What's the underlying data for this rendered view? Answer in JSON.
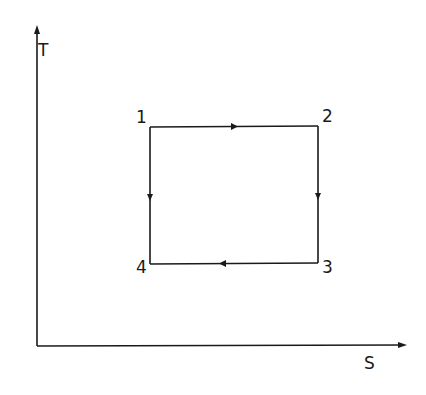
{
  "diagram": {
    "type": "T-S diagram (rectangular cycle)",
    "axes": {
      "y_label": "T",
      "x_label": "S"
    },
    "states": [
      {
        "id": "1",
        "label": "1"
      },
      {
        "id": "2",
        "label": "2"
      },
      {
        "id": "3",
        "label": "3"
      },
      {
        "id": "4",
        "label": "4"
      }
    ],
    "processes": [
      {
        "from": "1",
        "to": "2",
        "direction": "right"
      },
      {
        "from": "2",
        "to": "3",
        "direction": "down"
      },
      {
        "from": "3",
        "to": "4",
        "direction": "left"
      },
      {
        "from": "1",
        "to": "4",
        "direction": "down"
      }
    ],
    "colors": {
      "line": "#1a1a1a",
      "background": "#ffffff"
    }
  }
}
